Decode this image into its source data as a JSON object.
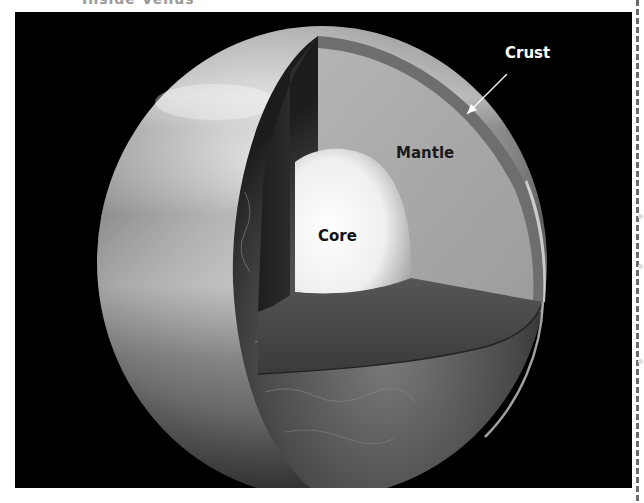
{
  "figure": {
    "caption": "Inside Venus",
    "labels": {
      "crust": "Crust",
      "mantle": "Mantle",
      "core": "Core"
    },
    "colors": {
      "background": "#000000",
      "mantle": "#a9a9a9",
      "core": "#f2f2f2",
      "crust_band": "#6e6e6e",
      "cut_wall": "#2e2e2e",
      "cut_floor": "#4a4a4a",
      "atmosphere": "#bdbdbd",
      "label_light": "#ffffff",
      "label_dark": "#111111"
    }
  }
}
